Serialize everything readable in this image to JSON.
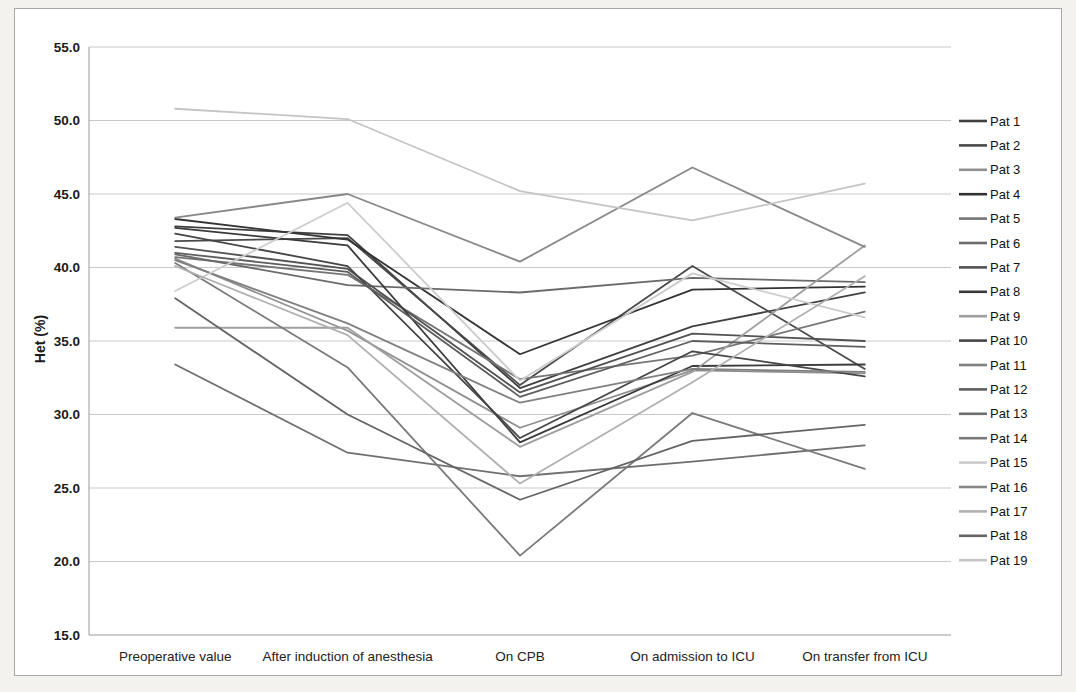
{
  "figure": {
    "background_color": "#f3f2ef",
    "frame_border_color": "#a8a8a8",
    "plot_background": "#ffffff",
    "gridline_color": "#c9c9c9",
    "axis_line_color": "#9a9a9a"
  },
  "chart_data": {
    "type": "line",
    "title": "",
    "ylabel": "Het (%)",
    "xlabel": "",
    "ylim": [
      15.0,
      55.0
    ],
    "y_ticks": [
      "55.0",
      "50.0",
      "45.0",
      "40.0",
      "35.0",
      "30.0",
      "25.0",
      "20.0",
      "15.0"
    ],
    "y_tick_values": [
      55,
      50,
      45,
      40,
      35,
      30,
      25,
      20,
      15
    ],
    "grid": "horizontal",
    "legend_position": "right",
    "categories": [
      "Preoperative value",
      "After induction of anesthesia",
      "On CPB",
      "On admission to ICU",
      "On transfer from ICU"
    ],
    "series": [
      {
        "name": "Pat 1",
        "color": "#404040",
        "values": [
          42.8,
          42.2,
          31.8,
          36.0,
          38.3
        ]
      },
      {
        "name": "Pat 2",
        "color": "#4a4a4a",
        "values": [
          41.8,
          42.0,
          32.0,
          40.1,
          33.1
        ]
      },
      {
        "name": "Pat 3",
        "color": "#8f8f8f",
        "values": [
          40.6,
          35.7,
          29.1,
          33.0,
          32.8
        ]
      },
      {
        "name": "Pat 4",
        "color": "#333333",
        "values": [
          43.3,
          41.9,
          34.1,
          38.5,
          38.7
        ]
      },
      {
        "name": "Pat 5",
        "color": "#757575",
        "values": [
          40.7,
          39.5,
          32.4,
          34.0,
          37.0
        ]
      },
      {
        "name": "Pat 6",
        "color": "#6a6a6a",
        "values": [
          40.9,
          38.8,
          38.3,
          39.3,
          39.0
        ]
      },
      {
        "name": "Pat 7",
        "color": "#525252",
        "values": [
          41.4,
          39.9,
          31.5,
          35.5,
          35.0
        ]
      },
      {
        "name": "Pat 8",
        "color": "#3a3a3a",
        "values": [
          42.7,
          41.5,
          28.1,
          33.3,
          33.4
        ]
      },
      {
        "name": "Pat 9",
        "color": "#9e9e9e",
        "values": [
          35.9,
          35.9,
          27.8,
          32.9,
          41.5
        ]
      },
      {
        "name": "Pat 10",
        "color": "#454545",
        "values": [
          42.3,
          40.1,
          28.4,
          34.3,
          32.6
        ]
      },
      {
        "name": "Pat 11",
        "color": "#808080",
        "values": [
          40.5,
          36.2,
          30.8,
          33.1,
          32.9
        ]
      },
      {
        "name": "Pat 12",
        "color": "#5e5e5e",
        "values": [
          41.0,
          39.7,
          31.2,
          35.0,
          34.6
        ]
      },
      {
        "name": "Pat 13",
        "color": "#6f6f6f",
        "values": [
          33.4,
          27.4,
          25.8,
          26.8,
          27.9
        ]
      },
      {
        "name": "Pat 14",
        "color": "#7a7a7a",
        "values": [
          40.3,
          33.2,
          20.4,
          30.1,
          26.3
        ]
      },
      {
        "name": "Pat 15",
        "color": "#cccccc",
        "values": [
          38.4,
          44.4,
          32.3,
          39.6,
          36.6
        ]
      },
      {
        "name": "Pat 16",
        "color": "#888888",
        "values": [
          43.4,
          45.0,
          40.4,
          46.8,
          41.4
        ]
      },
      {
        "name": "Pat 17",
        "color": "#b0b0b0",
        "values": [
          40.1,
          35.4,
          25.3,
          32.2,
          39.4
        ]
      },
      {
        "name": "Pat 18",
        "color": "#646464",
        "values": [
          37.9,
          30.0,
          24.2,
          28.2,
          29.3
        ]
      },
      {
        "name": "Pat 19",
        "color": "#c4c4c4",
        "values": [
          50.8,
          50.1,
          45.2,
          43.2,
          45.7
        ]
      }
    ]
  }
}
